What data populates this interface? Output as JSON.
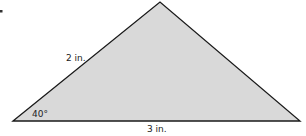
{
  "diagram": {
    "type": "triangle",
    "fill_color": "#d9d9d9",
    "stroke_color": "#1a1a1a",
    "vertices": {
      "left": [
        13,
        121
      ],
      "apex": [
        160,
        2
      ],
      "right": [
        300,
        121
      ]
    },
    "labels": {
      "left_side": "2 in.",
      "base": "3 in.",
      "angle": "40°"
    }
  }
}
